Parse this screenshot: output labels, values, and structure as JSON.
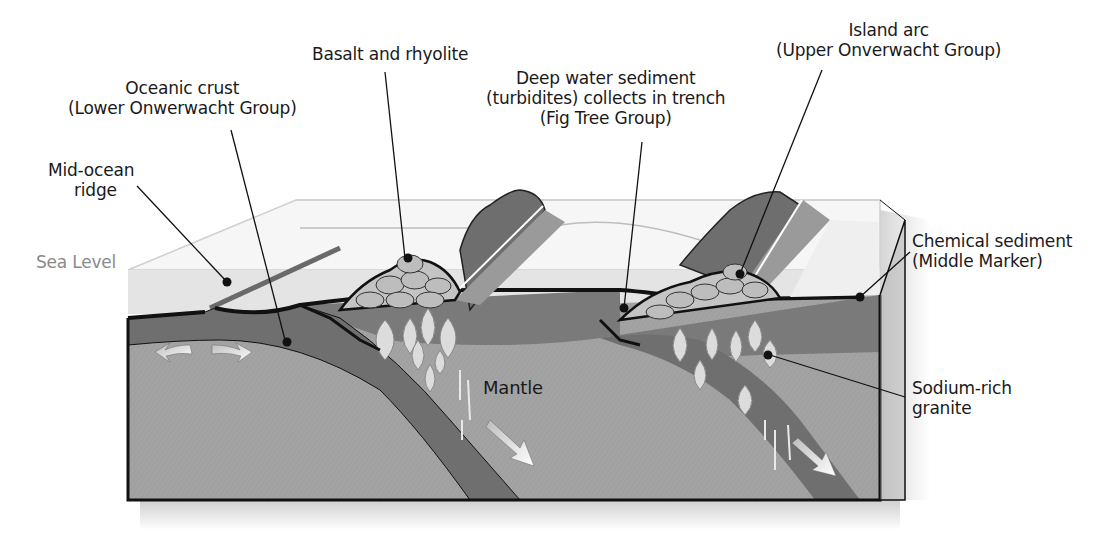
{
  "diagram": {
    "colors": {
      "background": "#ffffff",
      "water": "#e6e6e6",
      "water_top": "#f4f4f4",
      "oceanic_crust": "#707070",
      "mantle": "#a3a3a3",
      "upper_crust": "#858585",
      "sediment_pile": "#c4c4c4",
      "granite": "#d8d8d8",
      "outline": "#111111",
      "arc_volcano": "#6e6e6e",
      "arc_slab": "#9a9a9a",
      "arrow": "#f2f2f2",
      "sea_level_text": "#8a8a8a"
    },
    "labels": {
      "basalt": {
        "lines": [
          "Basalt and rhyolite"
        ]
      },
      "island_arc": {
        "lines": [
          "Island arc",
          "(Upper Onverwacht Group)"
        ]
      },
      "oceanic_crust": {
        "lines": [
          "Oceanic crust",
          "(Lower Onwerwacht Group)"
        ]
      },
      "deep_water": {
        "lines": [
          "Deep water sediment",
          "(turbidites) collects in trench",
          "(Fig Tree Group)"
        ]
      },
      "mid_ocean": {
        "lines": [
          "Mid-ocean",
          "ridge"
        ]
      },
      "sea_level": {
        "lines": [
          "Sea Level"
        ]
      },
      "chemical": {
        "lines": [
          "Chemical sediment",
          "(Middle Marker)"
        ]
      },
      "mantle": {
        "lines": [
          "Mantle"
        ]
      },
      "granite": {
        "lines": [
          "Sodium-rich",
          "granite"
        ]
      }
    }
  }
}
